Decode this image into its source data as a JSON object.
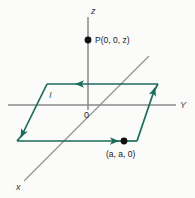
{
  "figure": {
    "background_color": "#fbfbfa",
    "axis_color": "#808080",
    "loop_color": "#1a6b5a",
    "dot_color": "#111111",
    "labels": {
      "z_axis": "z",
      "y_axis": "Y",
      "x_axis": "x",
      "origin": "0",
      "current": "I",
      "point_p": "P(0, 0, z)",
      "point_corner": "(a, a, 0)"
    },
    "axes": [
      {
        "name": "z-axis",
        "x1": 88,
        "y1": 17,
        "x2": 88,
        "y2": 110
      },
      {
        "name": "y-axis",
        "x1": 8,
        "y1": 105,
        "x2": 176,
        "y2": 105
      },
      {
        "name": "x-axis",
        "x1": 149,
        "y1": 56,
        "x2": 24,
        "y2": 181
      }
    ],
    "loop": {
      "shape": "parallelogram",
      "corners": [
        {
          "name": "top-left",
          "x": 47,
          "y": 84
        },
        {
          "name": "top-right",
          "x": 158,
          "y": 84
        },
        {
          "name": "bottom-right",
          "x": 137,
          "y": 141
        },
        {
          "name": "bottom-left",
          "x": 17,
          "y": 141
        }
      ],
      "current_direction": [
        "top edge: right to left",
        "left edge: top to bottom",
        "bottom edge: left to right",
        "right edge: bottom to top"
      ]
    },
    "points": [
      {
        "name": "P",
        "x": 88,
        "y": 40,
        "label": "P(0, 0, z)"
      },
      {
        "name": "corner",
        "x": 124,
        "y": 141,
        "label": "(a, a, 0)"
      }
    ]
  }
}
